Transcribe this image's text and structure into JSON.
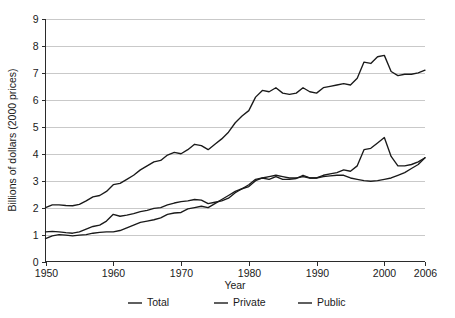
{
  "chart_data": {
    "type": "line",
    "title": "",
    "xlabel": "Year",
    "ylabel": "Billions of dollars (2000 prices)",
    "xlim": [
      1950,
      2006
    ],
    "ylim": [
      0,
      9
    ],
    "grid": true,
    "legend_position": "bottom",
    "y_ticks": [
      "0",
      "1",
      "2",
      "3",
      "4",
      "5",
      "6",
      "7",
      "8",
      "9"
    ],
    "x_ticks": [
      "1950",
      "1960",
      "1970",
      "1980",
      "1990",
      "2000",
      "2006"
    ],
    "x": [
      1950,
      1951,
      1952,
      1953,
      1954,
      1955,
      1956,
      1957,
      1958,
      1959,
      1960,
      1961,
      1962,
      1963,
      1964,
      1965,
      1966,
      1967,
      1968,
      1969,
      1970,
      1971,
      1972,
      1973,
      1974,
      1975,
      1976,
      1977,
      1978,
      1979,
      1980,
      1981,
      1982,
      1983,
      1984,
      1985,
      1986,
      1987,
      1988,
      1989,
      1990,
      1991,
      1992,
      1993,
      1994,
      1995,
      1996,
      1997,
      1998,
      1999,
      2000,
      2001,
      2002,
      2003,
      2004,
      2005,
      2006
    ],
    "series": [
      {
        "name": "Total",
        "color": "#1a1a1a",
        "values": [
          2.0,
          2.1,
          2.1,
          2.08,
          2.07,
          2.12,
          2.25,
          2.4,
          2.45,
          2.6,
          2.85,
          2.9,
          3.05,
          3.2,
          3.4,
          3.55,
          3.7,
          3.75,
          3.95,
          4.05,
          4.0,
          4.15,
          4.35,
          4.3,
          4.15,
          4.35,
          4.55,
          4.8,
          5.15,
          5.4,
          5.6,
          6.1,
          6.35,
          6.3,
          6.45,
          6.25,
          6.2,
          6.25,
          6.45,
          6.3,
          6.25,
          6.45,
          6.5,
          6.55,
          6.6,
          6.55,
          6.8,
          7.4,
          7.35,
          7.6,
          7.65,
          7.05,
          6.9,
          6.95,
          6.95,
          7.0,
          7.1
        ]
      },
      {
        "name": "Private",
        "color": "#1a1a1a",
        "values": [
          1.1,
          1.12,
          1.1,
          1.07,
          1.05,
          1.1,
          1.2,
          1.3,
          1.35,
          1.5,
          1.75,
          1.68,
          1.72,
          1.78,
          1.85,
          1.9,
          1.97,
          2.0,
          2.1,
          2.17,
          2.22,
          2.25,
          2.3,
          2.28,
          2.15,
          2.2,
          2.25,
          2.35,
          2.55,
          2.7,
          2.85,
          3.05,
          3.1,
          3.05,
          3.15,
          3.05,
          3.05,
          3.08,
          3.2,
          3.1,
          3.1,
          3.2,
          3.25,
          3.3,
          3.4,
          3.35,
          3.55,
          4.15,
          4.2,
          4.4,
          4.6,
          3.9,
          3.55,
          3.55,
          3.6,
          3.7,
          3.85
        ]
      },
      {
        "name": "Public",
        "color": "#1a1a1a",
        "values": [
          0.85,
          0.95,
          1.0,
          0.98,
          0.95,
          0.98,
          1.0,
          1.05,
          1.08,
          1.1,
          1.1,
          1.15,
          1.25,
          1.35,
          1.45,
          1.5,
          1.55,
          1.62,
          1.75,
          1.8,
          1.82,
          1.95,
          2.0,
          2.05,
          2.0,
          2.15,
          2.3,
          2.45,
          2.6,
          2.7,
          2.78,
          3.0,
          3.1,
          3.15,
          3.2,
          3.15,
          3.1,
          3.1,
          3.15,
          3.1,
          3.1,
          3.15,
          3.18,
          3.2,
          3.2,
          3.1,
          3.05,
          3.0,
          2.98,
          3.0,
          3.05,
          3.1,
          3.2,
          3.3,
          3.45,
          3.6,
          3.85
        ]
      }
    ],
    "legend": [
      {
        "label": "Total"
      },
      {
        "label": "Private"
      },
      {
        "label": "Public"
      }
    ]
  }
}
